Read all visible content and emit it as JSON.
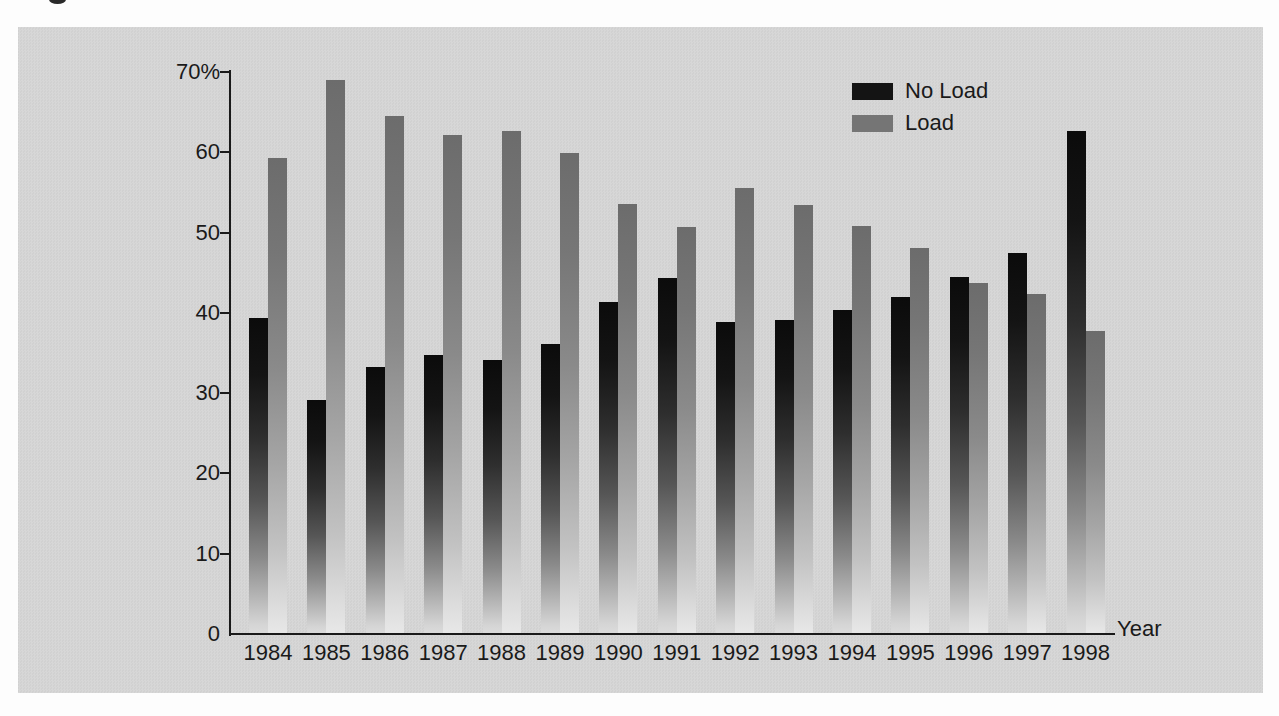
{
  "chart_data": {
    "type": "bar",
    "title": "",
    "categories": [
      "1984",
      "1985",
      "1986",
      "1987",
      "1988",
      "1989",
      "1990",
      "1991",
      "1992",
      "1993",
      "1994",
      "1995",
      "1996",
      "1997",
      "1998"
    ],
    "series": [
      {
        "name": "No Load",
        "key": "no-load",
        "color": "#141414",
        "values": [
          39.3,
          29.2,
          33.2,
          34.8,
          34.1,
          36.1,
          41.4,
          44.4,
          38.8,
          39.1,
          40.3,
          42.0,
          44.5,
          47.4,
          62.7
        ]
      },
      {
        "name": "Load",
        "key": "load",
        "color": "#757575",
        "values": [
          59.3,
          69.0,
          64.5,
          62.2,
          62.7,
          59.9,
          53.5,
          50.7,
          55.6,
          53.4,
          50.8,
          48.1,
          43.7,
          42.4,
          37.7
        ]
      }
    ],
    "xlabel": "Year",
    "ylabel": "",
    "ylim": [
      0,
      70
    ],
    "ytick_interval": 10,
    "ytick_labels": [
      "0",
      "10",
      "20",
      "30",
      "40",
      "50",
      "60",
      "70%"
    ],
    "values_unit": "percent",
    "grid": false,
    "legend_position": "top-right"
  },
  "colors": {
    "page_background": "#fdfdfd",
    "panel_background": "#d4d4d4",
    "axis": "#1a1a1a",
    "text": "#1a1a1a"
  }
}
